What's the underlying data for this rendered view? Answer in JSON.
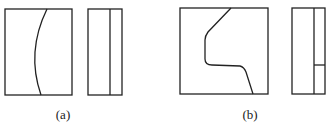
{
  "figures": [
    {
      "id": "a",
      "label": "(a)",
      "front_view": {
        "x": 5,
        "y": 9,
        "w": 67,
        "h": 86,
        "curve": "M47,9 Q26,52 41,95"
      },
      "side_view": {
        "x": 88,
        "y": 9,
        "w": 34,
        "h": 86,
        "divider_x": 110
      }
    },
    {
      "id": "b",
      "label": "(b)",
      "front_view": {
        "x": 180,
        "y": 8,
        "w": 88,
        "h": 86,
        "curve": "M231,8 L208,32 Q205,36 205,40 L205,59 Q205,65 212,65 L240,66 Q244,67 246,72 L253,94"
      },
      "side_view": {
        "x": 292,
        "y": 8,
        "w": 33,
        "h": 86,
        "divider_x": 314,
        "split_y": 65
      }
    }
  ],
  "colors": {
    "stroke": "#222222",
    "background": "#ffffff"
  }
}
